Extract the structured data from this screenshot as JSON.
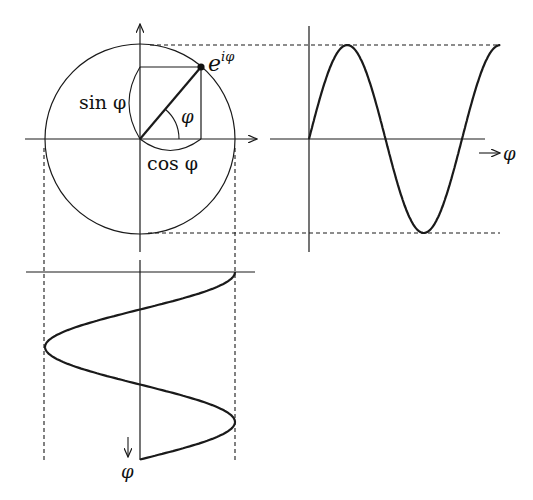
{
  "colors": {
    "stroke": "#1a1a1a",
    "background": "#ffffff"
  },
  "labels": {
    "point": "e",
    "point_exponent": "iφ",
    "sin": "sin φ",
    "cos": "cos φ",
    "angle": "φ",
    "sine_axis_var": "φ",
    "cosine_axis_var": "φ"
  },
  "geometry": {
    "circle": {
      "cx": 140,
      "cy": 139,
      "r": 95
    },
    "point_angle_deg": 50,
    "sine_plot": {
      "origin_x": 309,
      "axis_y": 139,
      "amplitude": 94,
      "period_px": 153,
      "periods": 1.25
    },
    "cosine_plot": {
      "origin_y": 272,
      "axis_x": 140,
      "amplitude": 95,
      "period_px": 150,
      "periods": 1.25
    }
  }
}
